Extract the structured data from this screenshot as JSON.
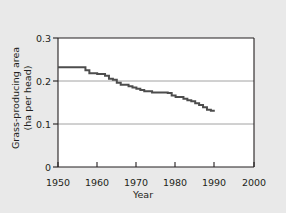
{
  "figure": {
    "background_color": "#e9e9e9",
    "plot_background_color": "#ffffff",
    "axis_color": "#231f20",
    "grid_color": "#8c8c8c",
    "line_color": "#4d4d4d"
  },
  "chart_data": {
    "type": "line",
    "title": "",
    "subtitle": "",
    "xlabel": "Year",
    "ylabel": "Grass-producing area (ha per head)",
    "ylabel_line1": "Grass-producing area",
    "ylabel_line2": "(ha per head)",
    "xlim": [
      1950,
      2000
    ],
    "ylim": [
      0,
      0.3
    ],
    "xticks": [
      1950,
      1960,
      1970,
      1980,
      1990,
      2000
    ],
    "xtick_labels": [
      "1950",
      "1960",
      "1970",
      "1980",
      "1990",
      "2000"
    ],
    "yticks": [
      0,
      0.1,
      0.2,
      0.3
    ],
    "ytick_labels": [
      "0",
      "0.1",
      "0.2",
      "0.3"
    ],
    "grid": "horizontal",
    "gridlines_at": [
      0.1,
      0.2
    ],
    "legend": "none",
    "step_style": "post",
    "x": [
      1950,
      1951,
      1952,
      1953,
      1954,
      1955,
      1956,
      1957,
      1958,
      1959,
      1960,
      1961,
      1962,
      1963,
      1964,
      1965,
      1966,
      1967,
      1968,
      1969,
      1970,
      1971,
      1972,
      1973,
      1974,
      1975,
      1976,
      1977,
      1978,
      1979,
      1980,
      1981,
      1982,
      1983,
      1984,
      1985,
      1986,
      1987,
      1988,
      1989,
      1990
    ],
    "values": [
      0.232,
      0.232,
      0.232,
      0.232,
      0.232,
      0.232,
      0.232,
      0.225,
      0.218,
      0.218,
      0.216,
      0.216,
      0.212,
      0.205,
      0.203,
      0.196,
      0.191,
      0.191,
      0.188,
      0.185,
      0.182,
      0.179,
      0.176,
      0.176,
      0.173,
      0.173,
      0.173,
      0.173,
      0.172,
      0.166,
      0.163,
      0.163,
      0.159,
      0.155,
      0.153,
      0.148,
      0.144,
      0.139,
      0.133,
      0.131,
      0.131
    ],
    "series": [
      {
        "name": "Grass-producing area per head",
        "values": [
          0.232,
          0.232,
          0.232,
          0.232,
          0.232,
          0.232,
          0.232,
          0.225,
          0.218,
          0.218,
          0.216,
          0.216,
          0.212,
          0.205,
          0.203,
          0.196,
          0.191,
          0.191,
          0.188,
          0.185,
          0.182,
          0.179,
          0.176,
          0.176,
          0.173,
          0.173,
          0.173,
          0.173,
          0.172,
          0.166,
          0.163,
          0.163,
          0.159,
          0.155,
          0.153,
          0.148,
          0.144,
          0.139,
          0.133,
          0.131,
          0.131
        ]
      }
    ]
  }
}
